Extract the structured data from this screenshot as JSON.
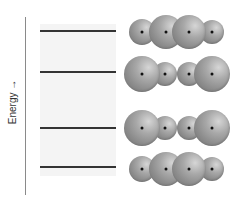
{
  "diagram": {
    "title": "",
    "axis_label": "Energy →",
    "colors": {
      "axis": "#8a8a8a",
      "level": "#333333",
      "panel": "#f4f4f4",
      "sphere": "#8c8c8c",
      "nucleus": "#111111"
    },
    "energy_levels": [
      {
        "id": 1,
        "y": 31
      },
      {
        "id": 2,
        "y": 72
      },
      {
        "id": 3,
        "y": 128
      },
      {
        "id": 4,
        "y": 167
      }
    ],
    "orbital_rows": [
      {
        "level": 1,
        "cy": 32,
        "atoms": [
          {
            "cx": 142,
            "r": 13
          },
          {
            "cx": 166,
            "r": 17
          },
          {
            "cx": 189,
            "r": 17
          },
          {
            "cx": 212,
            "r": 12
          }
        ]
      },
      {
        "level": 2,
        "cy": 74,
        "atoms": [
          {
            "cx": 142,
            "r": 18
          },
          {
            "cx": 165,
            "r": 12
          },
          {
            "cx": 189,
            "r": 12
          },
          {
            "cx": 212,
            "r": 18
          }
        ]
      },
      {
        "level": 3,
        "cy": 128,
        "atoms": [
          {
            "cx": 142,
            "r": 18
          },
          {
            "cx": 165,
            "r": 12
          },
          {
            "cx": 189,
            "r": 12
          },
          {
            "cx": 212,
            "r": 18
          }
        ]
      },
      {
        "level": 4,
        "cy": 169,
        "atoms": [
          {
            "cx": 142,
            "r": 13
          },
          {
            "cx": 166,
            "r": 17
          },
          {
            "cx": 189,
            "r": 17
          },
          {
            "cx": 212,
            "r": 12
          }
        ]
      }
    ]
  }
}
